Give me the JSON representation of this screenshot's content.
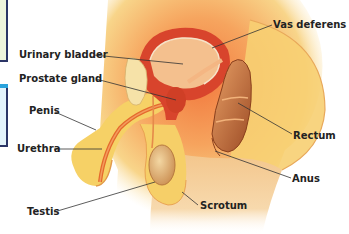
{
  "diagram": {
    "labels": {
      "urinary_bladder": "Urinary bladder",
      "prostate_gland": "Prostate gland",
      "penis": "Penis",
      "urethra": "Urethra",
      "testis": "Testis",
      "vas_deferens": "Vas deferens",
      "rectum": "Rectum",
      "anus": "Anus",
      "scrotum": "Scrotum"
    },
    "colors": {
      "skin": "#f6d77a",
      "skin_light": "#fbe9a8",
      "tissue_orange": "#f08a4b",
      "tissue_red": "#d8432b",
      "organ_wall": "#c23a22",
      "rectum_brown": "#b8643a",
      "leader_line": "#333333"
    }
  }
}
